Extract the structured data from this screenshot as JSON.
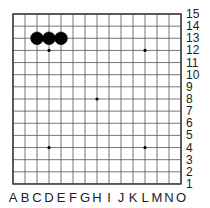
{
  "board": {
    "size": 15,
    "origin_x": 13,
    "origin_y": 14,
    "spacing_x": 12,
    "spacing_y": 12.14,
    "line_color": "#555555",
    "border_color": "#333333",
    "background": "#ffffff"
  },
  "columns": [
    "A",
    "B",
    "C",
    "D",
    "E",
    "F",
    "G",
    "H",
    "I",
    "J",
    "K",
    "L",
    "M",
    "N",
    "O"
  ],
  "rows": [
    "15",
    "14",
    "13",
    "12",
    "11",
    "10",
    "9",
    "8",
    "7",
    "6",
    "5",
    "4",
    "3",
    "2",
    "1"
  ],
  "star_points": [
    "D12",
    "L12",
    "H8",
    "D4",
    "L4"
  ],
  "stones": [
    {
      "point": "C13",
      "color": "black"
    },
    {
      "point": "D13",
      "color": "black"
    },
    {
      "point": "E13",
      "color": "black"
    }
  ]
}
